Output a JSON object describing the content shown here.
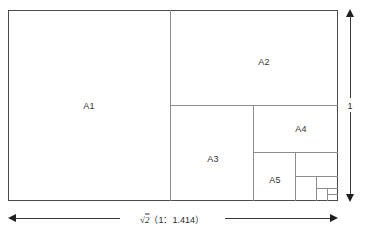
{
  "diagram": {
    "stroke_color": "#4a4a4a",
    "inner_stroke_color": "#8d8d8d",
    "arrow_color": "#1f1f1f",
    "background": "#ffffff"
  },
  "regions": [
    {
      "id": "A1",
      "label": "A1",
      "x": 8,
      "y": 10,
      "w": 162,
      "h": 190
    },
    {
      "id": "A2",
      "label": "A2",
      "x": 170,
      "y": 10,
      "w": 167,
      "h": 95
    },
    {
      "id": "A3",
      "label": "A3",
      "x": 170,
      "y": 105,
      "w": 83,
      "h": 95
    },
    {
      "id": "A4",
      "label": "A4",
      "x": 253,
      "y": 105,
      "w": 84,
      "h": 47
    },
    {
      "id": "A5",
      "label": "A5",
      "x": 253,
      "y": 152,
      "w": 42,
      "h": 48
    },
    {
      "id": "A6",
      "label": "",
      "x": 295,
      "y": 152,
      "w": 42,
      "h": 24
    },
    {
      "id": "A7",
      "label": "",
      "x": 295,
      "y": 176,
      "w": 21,
      "h": 24
    },
    {
      "id": "A8",
      "label": "",
      "x": 316,
      "y": 176,
      "w": 21,
      "h": 12
    },
    {
      "id": "A9",
      "label": "",
      "x": 316,
      "y": 188,
      "w": 11,
      "h": 12
    },
    {
      "id": "A10",
      "label": "",
      "x": 327,
      "y": 188,
      "w": 10,
      "h": 6
    }
  ],
  "dimensions": {
    "width": {
      "label_prefix": "√2",
      "label_ratio": "（1：1.414）",
      "label_full": "√2（1：1.414）",
      "value": 1.414,
      "orientation": "horizontal"
    },
    "height": {
      "label": "1",
      "value": 1,
      "orientation": "vertical"
    }
  }
}
